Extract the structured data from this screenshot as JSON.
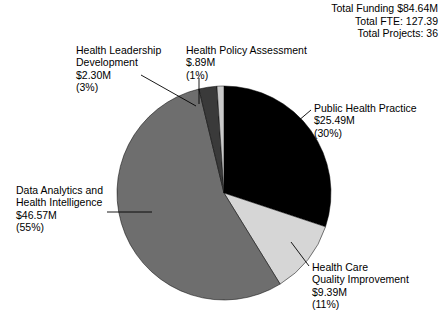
{
  "summary": {
    "total_funding": "Total Funding $84.64M",
    "total_fte": "Total FTE: 127.39",
    "total_projects": "Total Projects: 36"
  },
  "chart_data": {
    "type": "pie",
    "title": "",
    "legend_position": "callout-labels",
    "start_angle_deg": 0,
    "direction": "clockwise",
    "center": [
      224,
      193
    ],
    "radius": 107,
    "categories": [
      "Public Health Practice",
      "Health Care Quality Improvement",
      "Data Analytics and Health Intelligence",
      "Health Leadership Development",
      "Health Policy Assessment"
    ],
    "values": [
      25.49,
      9.39,
      46.57,
      2.3,
      0.89
    ],
    "percents": [
      30,
      11,
      55,
      3,
      1
    ],
    "colors": [
      "#000000",
      "#d6d6d6",
      "#6e6e6e",
      "#3a3a3a",
      "#c9c9c9"
    ],
    "units": "USD millions",
    "slices": [
      {
        "name": "Public Health Practice",
        "value": 25.49,
        "percent": 30,
        "color": "#000000",
        "label_lines": [
          "Public Health Practice",
          "$25.49M",
          "(30%)"
        ]
      },
      {
        "name": "Health Care Quality Improvement",
        "value": 9.39,
        "percent": 11,
        "color": "#d6d6d6",
        "label_lines": [
          "Health Care",
          "Quality Improvement",
          "$9.39M",
          "(11%)"
        ]
      },
      {
        "name": "Data Analytics and Health Intelligence",
        "value": 46.57,
        "percent": 55,
        "color": "#6e6e6e",
        "label_lines": [
          "Data Analytics and",
          "Health Intelligence",
          "$46.57M",
          "(55%)"
        ]
      },
      {
        "name": "Health Leadership Development",
        "value": 2.3,
        "percent": 3,
        "color": "#3a3a3a",
        "label_lines": [
          "Health Leadership",
          "Development",
          "$2.30M",
          "(3%)"
        ]
      },
      {
        "name": "Health Policy Assessment",
        "value": 0.89,
        "percent": 1,
        "color": "#c9c9c9",
        "label_lines": [
          "Health Policy Assessment",
          "$.89M",
          "(1%)"
        ]
      }
    ]
  },
  "labels": {
    "public_health_practice": {
      "l1": "Public Health Practice",
      "l2": "$25.49M",
      "l3": "(30%)"
    },
    "health_care_quality": {
      "l1": "Health Care",
      "l2": "Quality Improvement",
      "l3": "$9.39M",
      "l4": "(11%)"
    },
    "data_analytics": {
      "l1": "Data Analytics and",
      "l2": "Health Intelligence",
      "l3": "$46.57M",
      "l4": "(55%)"
    },
    "health_leadership": {
      "l1": "Health Leadership",
      "l2": "Development",
      "l3": "$2.30M",
      "l4": "(3%)"
    },
    "health_policy": {
      "l1": "Health Policy Assessment",
      "l2": "$.89M",
      "l3": "(1%)"
    }
  }
}
